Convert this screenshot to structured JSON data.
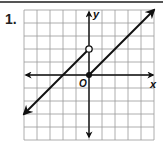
{
  "problem": {
    "number": "1."
  },
  "chart_data": {
    "type": "line",
    "title": "",
    "xlabel": "x",
    "ylabel": "y",
    "origin_label": "O",
    "xlim": [
      -5,
      5
    ],
    "ylim": [
      -5,
      5
    ],
    "grid": true,
    "grid_step": 1,
    "tick_labels": false,
    "series": [
      {
        "name": "left piece",
        "equation": "y = x + 2",
        "domain": "x < 0",
        "points": [
          [
            -5,
            -3
          ],
          [
            0,
            2
          ]
        ],
        "start_arrow": true,
        "end_marker": "open-circle",
        "end_point": [
          0,
          2
        ]
      },
      {
        "name": "right piece",
        "equation": "y = x",
        "domain": "x >= 0",
        "points": [
          [
            0,
            0
          ],
          [
            5,
            5
          ]
        ],
        "start_marker": "closed-dot",
        "start_point": [
          0,
          0
        ],
        "end_arrow": true
      }
    ],
    "axes_arrows": true
  }
}
